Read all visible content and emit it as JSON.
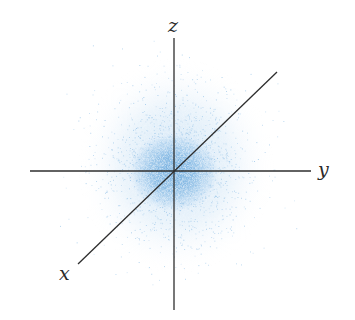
{
  "diagram": {
    "title": "",
    "labels": {
      "x": "x",
      "y": "y",
      "z": "z"
    },
    "colors": {
      "cloud": "#7fb6e3",
      "cloud_core": "#6aa8dc",
      "axis": "#2e2e2e",
      "background": "#ffffff"
    },
    "geometry": {
      "origin": [
        174,
        171
      ],
      "z_axis": [
        [
          174,
          38
        ],
        [
          174,
          310
        ]
      ],
      "y_axis": [
        [
          30,
          171
        ],
        [
          311,
          171
        ]
      ],
      "x_axis": [
        [
          277,
          72
        ],
        [
          78,
          264
        ]
      ]
    }
  }
}
